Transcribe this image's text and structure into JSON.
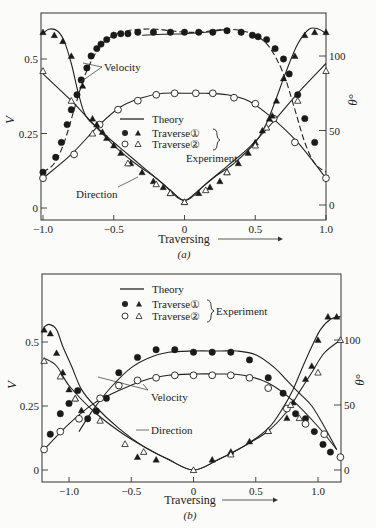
{
  "chart_data": [
    {
      "type": "line",
      "panel": "a",
      "caption": "(a)",
      "xlabel": "Traversing",
      "ylabel_left": "V",
      "ylabel_right": "θ°",
      "xlim": [
        -1.0,
        1.0
      ],
      "ylim_left": [
        0,
        0.6
      ],
      "ylim_right": [
        0,
        120
      ],
      "xticks": [
        {
          "v": -1.0,
          "label": "-1.0"
        },
        {
          "v": -0.5,
          "label": "-0.5"
        },
        {
          "v": 0,
          "label": "0"
        },
        {
          "v": 0.5,
          "label": "0.5"
        },
        {
          "v": 1.0,
          "label": "1.0"
        }
      ],
      "yticks_left": [
        {
          "v": 0,
          "label": "0"
        },
        {
          "v": 0.25,
          "label": "0.25"
        },
        {
          "v": 0.5,
          "label": "0.5"
        }
      ],
      "yticks_right": [
        {
          "v": 0,
          "label": "0"
        },
        {
          "v": 50,
          "label": "50"
        },
        {
          "v": 100,
          "label": "100"
        }
      ],
      "legend": {
        "theory": "Theory",
        "traverse1": "Traverse①",
        "traverse2": "Traverse②",
        "group": "Experiment",
        "placement": "center"
      },
      "annotations": {
        "velocity": "Velocity",
        "direction": "Direction"
      },
      "series": [
        {
          "name": "Velocity theory T1",
          "axis": "left",
          "style": "dashed",
          "x": [
            -1.0,
            -0.92,
            -0.85,
            -0.78,
            -0.7,
            -0.6,
            -0.5,
            -0.4,
            -0.3,
            -0.2,
            -0.1,
            0,
            0.1,
            0.2,
            0.3,
            0.4,
            0.5,
            0.6,
            0.7,
            0.78,
            0.85,
            0.92,
            1.0
          ],
          "y": [
            0.12,
            0.15,
            0.22,
            0.33,
            0.45,
            0.54,
            0.58,
            0.595,
            0.6,
            0.6,
            0.595,
            0.59,
            0.59,
            0.595,
            0.6,
            0.595,
            0.58,
            0.54,
            0.45,
            0.33,
            0.22,
            0.15,
            0.12
          ]
        },
        {
          "name": "Traverse 1 velocity",
          "axis": "left",
          "marker": "filled-circle",
          "x": [
            -1.0,
            -0.91,
            -0.87,
            -0.83,
            -0.8,
            -0.76,
            -0.73,
            -0.69,
            -0.66,
            -0.62,
            -0.59,
            -0.55,
            -0.5,
            -0.45,
            -0.4,
            -0.33,
            -0.22,
            -0.1,
            0,
            0.1,
            0.2,
            0.3,
            0.4,
            0.48,
            0.52,
            0.58,
            0.64,
            0.7,
            0.74,
            0.8,
            0.85,
            0.92
          ],
          "y": [
            0.12,
            0.17,
            0.22,
            0.28,
            0.33,
            0.38,
            0.43,
            0.47,
            0.51,
            0.535,
            0.55,
            0.565,
            0.58,
            0.585,
            0.585,
            0.59,
            0.59,
            0.59,
            0.59,
            0.59,
            0.59,
            0.595,
            0.59,
            0.58,
            0.575,
            0.565,
            0.535,
            0.5,
            0.45,
            0.38,
            0.3,
            0.22
          ]
        },
        {
          "name": "Traverse 2 velocity",
          "axis": "left",
          "marker": "open-circle",
          "x": [
            -1.0,
            -0.78,
            -0.6,
            -0.47,
            -0.33,
            -0.2,
            -0.07,
            0.08,
            0.2,
            0.35,
            0.5,
            0.63,
            0.78,
            1.0
          ],
          "y": [
            0.1,
            0.18,
            0.28,
            0.33,
            0.36,
            0.38,
            0.385,
            0.385,
            0.385,
            0.37,
            0.35,
            0.3,
            0.22,
            0.1
          ]
        },
        {
          "name": "Traverse 1 direction",
          "axis": "right",
          "marker": "filled-triangle",
          "x": [
            -1.0,
            -0.92,
            -0.86,
            -0.8,
            -0.72,
            -0.65,
            -0.62,
            -0.58,
            -0.55,
            -0.5,
            -0.45,
            -0.38,
            -0.3,
            -0.22,
            -0.15,
            -0.1,
            0,
            0.1,
            0.18,
            0.25,
            0.3,
            0.38,
            0.45,
            0.5,
            0.55,
            0.6,
            0.62,
            0.65,
            0.7,
            0.78,
            0.85,
            0.92,
            1.0
          ],
          "y": [
            116,
            114,
            110,
            100,
            80,
            58,
            54,
            49,
            45,
            40,
            35,
            28,
            22,
            16,
            12,
            8,
            2,
            8,
            12,
            16,
            22,
            28,
            35,
            42,
            50,
            58,
            60,
            70,
            85,
            100,
            114,
            116,
            116
          ]
        },
        {
          "name": "Traverse 2 direction",
          "axis": "right",
          "marker": "open-triangle",
          "x": [
            -1.0,
            -0.8,
            -0.65,
            -0.4,
            -0.2,
            -0.1,
            0,
            0.15,
            0.3,
            0.5,
            0.58,
            0.8,
            1.0
          ],
          "y": [
            90,
            70,
            48,
            28,
            14,
            8,
            2,
            10,
            22,
            40,
            52,
            70,
            90
          ]
        },
        {
          "name": "Velocity theory (solid)",
          "axis": "left",
          "style": "solid",
          "x": [
            -0.3,
            -0.15,
            0,
            0.15,
            0.3
          ],
          "y": [
            0.58,
            0.583,
            0.585,
            0.59,
            0.6
          ]
        },
        {
          "name": "Velocity theory T2",
          "axis": "left",
          "style": "solid",
          "x": [
            -1.0,
            -0.8,
            -0.6,
            -0.45,
            -0.3,
            -0.15,
            0,
            0.15,
            0.3,
            0.45,
            0.6,
            0.8,
            1.0
          ],
          "y": [
            0.1,
            0.18,
            0.28,
            0.34,
            0.37,
            0.385,
            0.385,
            0.385,
            0.38,
            0.36,
            0.31,
            0.22,
            0.1
          ]
        },
        {
          "name": "Direction theory T1",
          "axis": "right",
          "style": "solid",
          "x": [
            -1.0,
            -0.96,
            -0.9,
            -0.85,
            -0.8,
            -0.75,
            -0.7,
            -0.62,
            -0.5,
            -0.35,
            -0.2,
            -0.1,
            0,
            0.1,
            0.2,
            0.35,
            0.5,
            0.58,
            0.65,
            0.72,
            0.8,
            0.88,
            0.95,
            1.0
          ],
          "y": [
            115,
            118,
            117,
            110,
            95,
            75,
            60,
            52,
            40,
            28,
            18,
            10,
            3,
            10,
            18,
            28,
            42,
            55,
            72,
            90,
            108,
            118,
            118,
            115
          ]
        },
        {
          "name": "Direction theory T2",
          "axis": "right",
          "style": "solid",
          "x": [
            -1.0,
            -0.8,
            -0.62,
            -0.45,
            -0.3,
            -0.15,
            0,
            0.15,
            0.3,
            0.45,
            0.62,
            0.8,
            1.0
          ],
          "y": [
            88,
            70,
            52,
            38,
            26,
            14,
            3,
            14,
            26,
            38,
            55,
            75,
            95
          ]
        }
      ]
    },
    {
      "type": "line",
      "panel": "b",
      "caption": "(b)",
      "xlabel": "Traversing",
      "ylabel_left": "V",
      "ylabel_right": "θ°",
      "xlim": [
        -1.2,
        1.2
      ],
      "ylim_left": [
        0,
        0.6
      ],
      "ylim_right": [
        0,
        120
      ],
      "xticks": [
        {
          "v": -1.0,
          "label": "-1.0"
        },
        {
          "v": -0.5,
          "label": "-0.5"
        },
        {
          "v": 0,
          "label": "0"
        },
        {
          "v": 0.5,
          "label": "0.5"
        },
        {
          "v": 1.0,
          "label": "1.0"
        }
      ],
      "yticks_left": [
        {
          "v": 0,
          "label": "0"
        },
        {
          "v": 0.25,
          "label": "0.25"
        },
        {
          "v": 0.5,
          "label": "0.5"
        }
      ],
      "yticks_right": [
        {
          "v": 0,
          "label": "0"
        },
        {
          "v": 50,
          "label": "50"
        },
        {
          "v": 100,
          "label": "100"
        }
      ],
      "legend": {
        "theory": "Theory",
        "traverse1": "Traverse①",
        "traverse2": "Traverse②",
        "group": "Experiment",
        "placement": "top"
      },
      "annotations": {
        "velocity": "Velocity",
        "direction": "Direction"
      },
      "series": [
        {
          "name": "Traverse 1 velocity",
          "axis": "left",
          "marker": "filled-circle",
          "x": [
            -1.15,
            -1.07,
            -1.0,
            -0.93,
            -0.85,
            -0.78,
            -0.7,
            -0.6,
            -0.45,
            -0.3,
            -0.15,
            0,
            0.15,
            0.3,
            0.45,
            0.6,
            0.72,
            0.82,
            0.9,
            0.97,
            1.04,
            1.1
          ],
          "y": [
            0.14,
            0.22,
            0.26,
            0.31,
            0.2,
            0.23,
            0.28,
            0.38,
            0.44,
            0.47,
            0.47,
            0.46,
            0.46,
            0.46,
            0.43,
            0.36,
            0.3,
            0.22,
            0.2,
            0.15,
            0.1,
            0.07
          ]
        },
        {
          "name": "Traverse 2 velocity",
          "axis": "left",
          "marker": "open-circle",
          "x": [
            -1.2,
            -1.07,
            -0.92,
            -0.75,
            -0.6,
            -0.45,
            -0.3,
            -0.15,
            0,
            0.15,
            0.3,
            0.45,
            0.6,
            0.75,
            0.9,
            1.05,
            1.18
          ],
          "y": [
            0.08,
            0.15,
            0.2,
            0.28,
            0.33,
            0.35,
            0.36,
            0.37,
            0.37,
            0.37,
            0.37,
            0.36,
            0.32,
            0.24,
            0.18,
            0.14,
            0.05
          ]
        },
        {
          "name": "Traverse 1 direction",
          "axis": "right",
          "marker": "filled-triangle",
          "x": [
            -1.2,
            -1.15,
            -1.1,
            -1.05,
            -1.0,
            -0.95,
            -0.9,
            -0.45,
            -0.3,
            0.15,
            0.3,
            0.45,
            0.6,
            0.75,
            0.8,
            0.9,
            0.95,
            1.0,
            1.08,
            1.15
          ],
          "y": [
            108,
            105,
            90,
            75,
            62,
            55,
            46,
            10,
            8,
            8,
            14,
            22,
            30,
            40,
            52,
            70,
            80,
            100,
            118,
            118
          ]
        },
        {
          "name": "Traverse 2 direction",
          "axis": "right",
          "marker": "open-triangle",
          "x": [
            -1.2,
            -1.07,
            -0.95,
            -0.75,
            -0.55,
            -0.4,
            0,
            0.3,
            0.6,
            0.78,
            0.85,
            1.0,
            1.18
          ],
          "y": [
            84,
            72,
            55,
            38,
            20,
            14,
            0,
            12,
            30,
            50,
            40,
            75,
            100
          ]
        },
        {
          "name": "Velocity theory T1",
          "axis": "left",
          "style": "solid",
          "x": [
            -0.92,
            -0.8,
            -0.65,
            -0.5,
            -0.35,
            -0.2,
            0,
            0.2,
            0.35,
            0.5,
            0.65,
            0.75,
            0.85,
            0.95,
            1.05,
            1.15
          ],
          "y": [
            0.15,
            0.24,
            0.33,
            0.4,
            0.44,
            0.46,
            0.465,
            0.465,
            0.465,
            0.45,
            0.4,
            0.35,
            0.3,
            0.25,
            0.17,
            0.08
          ]
        },
        {
          "name": "Velocity theory T2",
          "axis": "left",
          "style": "solid",
          "x": [
            -1.2,
            -1.0,
            -0.8,
            -0.6,
            -0.4,
            -0.2,
            0,
            0.2,
            0.4,
            0.6,
            0.8,
            1.0,
            1.15
          ],
          "y": [
            0.08,
            0.18,
            0.26,
            0.31,
            0.35,
            0.37,
            0.375,
            0.375,
            0.37,
            0.34,
            0.27,
            0.17,
            0.08
          ]
        },
        {
          "name": "Direction theory T1",
          "axis": "right",
          "style": "solid",
          "x": [
            -1.2,
            -1.16,
            -1.1,
            -1.05,
            -0.98,
            -0.9,
            -0.8,
            -0.6,
            -0.4,
            -0.2,
            0,
            0.2,
            0.4,
            0.6,
            0.72,
            0.8,
            0.88,
            0.95,
            1.02,
            1.1,
            1.18
          ],
          "y": [
            110,
            112,
            108,
            95,
            80,
            62,
            50,
            32,
            18,
            8,
            0,
            8,
            18,
            32,
            48,
            62,
            80,
            95,
            108,
            116,
            118
          ]
        },
        {
          "name": "Direction theory T2",
          "axis": "right",
          "style": "solid",
          "x": [
            -1.2,
            -1.1,
            -1.0,
            -0.8,
            -0.6,
            -0.4,
            -0.2,
            0,
            0.2,
            0.4,
            0.6,
            0.75,
            0.85,
            0.95,
            1.05,
            1.18
          ],
          "y": [
            86,
            80,
            65,
            45,
            30,
            18,
            8,
            0,
            8,
            18,
            30,
            45,
            60,
            75,
            90,
            100
          ]
        }
      ]
    }
  ]
}
